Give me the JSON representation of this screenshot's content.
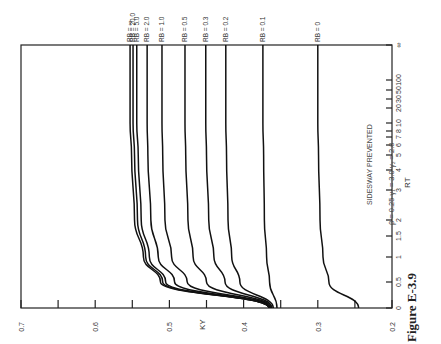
{
  "figure": {
    "caption": "Figure E-3.9",
    "annotation_line1": "SIDESWAY PREVENTED",
    "annotation_line2": "β = 0.25   γ₁ = 3.0   γ₂ = 2.0"
  },
  "chart_data": {
    "type": "line",
    "orientation": "rotated 90° counter-clockwise (R_T axis vertical on right, K_Y axis horizontal at bottom)",
    "title": "",
    "xlabel": "R_T",
    "ylabel": "K_Y",
    "x_scale": "nonlinear (compressed, ends at ∞)",
    "x_ticks": [
      "0",
      "0.5",
      "1",
      "1.5",
      "2",
      "3",
      "4",
      "5",
      "6",
      "7",
      "8",
      "10",
      "20",
      "30",
      "50",
      "100",
      "∞"
    ],
    "y_ticks": [
      "0.2",
      "0.3",
      "0.4",
      "0.5",
      "0.6",
      "0.7"
    ],
    "ylim": [
      0.2,
      0.7
    ],
    "grid": false,
    "legend": "curve labels at ∞ end",
    "x": [
      0,
      0.5,
      1,
      2,
      5,
      10,
      100,
      "∞"
    ],
    "series": [
      {
        "name": "R_B = 0",
        "values": [
          0.245,
          0.285,
          0.293,
          0.297,
          0.299,
          0.3,
          0.3,
          0.3
        ]
      },
      {
        "name": "R_B = 0.1",
        "values": [
          0.355,
          0.365,
          0.369,
          0.372,
          0.373,
          0.374,
          0.374,
          0.374
        ]
      },
      {
        "name": "R_B = 0.2",
        "values": [
          0.36,
          0.405,
          0.416,
          0.421,
          0.423,
          0.424,
          0.424,
          0.424
        ]
      },
      {
        "name": "R_B = 0.3",
        "values": [
          0.362,
          0.425,
          0.44,
          0.447,
          0.45,
          0.451,
          0.451,
          0.451
        ]
      },
      {
        "name": "R_B = 0.5",
        "values": [
          0.363,
          0.45,
          0.468,
          0.475,
          0.478,
          0.479,
          0.479,
          0.479
        ]
      },
      {
        "name": "R_B = 1.0",
        "values": [
          0.364,
          0.476,
          0.497,
          0.506,
          0.509,
          0.51,
          0.51,
          0.51
        ]
      },
      {
        "name": "R_B = 2.0",
        "values": [
          0.365,
          0.493,
          0.515,
          0.525,
          0.529,
          0.53,
          0.53,
          0.53
        ]
      },
      {
        "name": "R_B = 5.0",
        "values": [
          0.366,
          0.505,
          0.527,
          0.538,
          0.542,
          0.544,
          0.544,
          0.544
        ]
      },
      {
        "name": "R_B = 20.0",
        "values": [
          0.366,
          0.509,
          0.532,
          0.543,
          0.547,
          0.549,
          0.549,
          0.549
        ]
      },
      {
        "name": "R_B = ∞",
        "values": [
          0.366,
          0.512,
          0.535,
          0.547,
          0.551,
          0.553,
          0.553,
          0.553
        ]
      }
    ]
  }
}
